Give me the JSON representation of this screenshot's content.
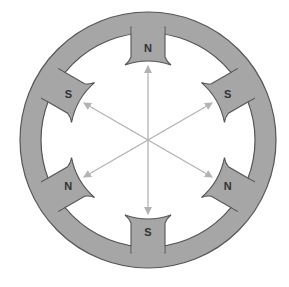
{
  "diagram": {
    "type": "stator-magnetic-poles",
    "colors": {
      "ring_fill": "#a6a6a6",
      "ring_stroke": "#555555",
      "arrow": "#b3b3b3",
      "label": "#333333",
      "background": "#ffffff"
    },
    "center": [
      148,
      140
    ],
    "outer_radius": 128,
    "inner_radius": 107,
    "poles": [
      {
        "label": "N",
        "angle": -90
      },
      {
        "label": "S",
        "angle": -30
      },
      {
        "label": "N",
        "angle": 30
      },
      {
        "label": "S",
        "angle": 90
      },
      {
        "label": "N",
        "angle": 150
      },
      {
        "label": "S",
        "angle": 210
      }
    ],
    "arrows": [
      {
        "from_angle": -90,
        "to_angle": 90
      },
      {
        "from_angle": -30,
        "to_angle": 150
      },
      {
        "from_angle": 30,
        "to_angle": 210
      }
    ]
  }
}
